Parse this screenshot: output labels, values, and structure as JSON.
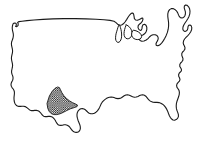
{
  "figure": {
    "kind": "map",
    "background_color": "#ffffff",
    "outline_color": "#1a1a1a",
    "outline_width_px": 1,
    "width_px": 203,
    "height_px": 145,
    "has_interior_state_borders": false,
    "has_visible_text": false,
    "caption": ""
  },
  "regions": [
    {
      "name": "contiguous-united-states",
      "role": "country-outline",
      "fill": "#ffffff",
      "stroke": "#1a1a1a",
      "pattern": "none"
    },
    {
      "name": "great-lakes",
      "role": "water-body-outline",
      "fill": "#ffffff",
      "stroke": "#1a1a1a",
      "pattern": "none"
    }
  ],
  "highlight": {
    "name": "southwest-highlighted-state",
    "label": "",
    "pattern": "checkered-dot-halftone",
    "pattern_color": "#111111",
    "pattern_background": "#ffffff",
    "pattern_cell_px": 2.2,
    "approx_bounds": {
      "x": 45,
      "y": 86,
      "width": 33,
      "height": 29
    },
    "approx_region": "southwest"
  },
  "legend": {
    "visible": false,
    "entries": []
  },
  "annotations": []
}
